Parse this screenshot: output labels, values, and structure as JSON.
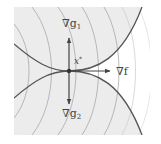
{
  "diagram": {
    "labels": {
      "grad_g1": "∇g",
      "grad_g1_sub": "1",
      "grad_g2": "∇g",
      "grad_g2_sub": "2",
      "grad_f": "∇f",
      "x_star": "x",
      "x_star_sup": "*"
    },
    "colors": {
      "shaded_region": "#ececec",
      "contour_line": "#9a9a9a",
      "constraint_curve": "#555555",
      "arrow": "#444444",
      "background": "#ffffff"
    }
  }
}
